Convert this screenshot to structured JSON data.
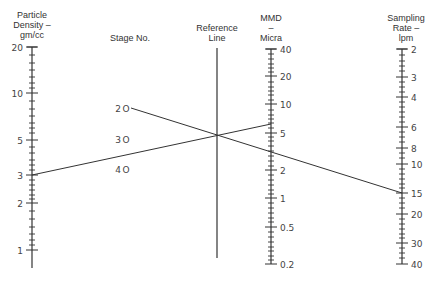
{
  "chart_data": {
    "type": "nomogram",
    "title": "",
    "axes": [
      {
        "id": "particle_density",
        "title_lines": [
          "Particle",
          "Density –",
          "gm/cc"
        ],
        "scale": "log",
        "x": 32,
        "range": [
          0.8,
          20
        ],
        "ticks": [
          {
            "value": 20,
            "label": "20",
            "y": 47
          },
          {
            "value": 10,
            "label": "10",
            "y": 93
          },
          {
            "value": 5,
            "label": "5",
            "y": 140
          },
          {
            "value": 3,
            "label": "3",
            "y": 175
          },
          {
            "value": 2,
            "label": "2",
            "y": 203
          },
          {
            "value": 1,
            "label": "1",
            "y": 250
          }
        ],
        "minor_ticks_y": [
          55,
          63,
          70,
          77,
          83,
          88,
          101,
          109,
          116,
          123,
          128,
          133,
          147,
          153,
          160,
          165,
          170,
          180,
          185,
          190,
          195,
          199,
          211,
          219,
          227,
          234,
          240,
          245
        ],
        "end_y": [
          47,
          268
        ],
        "label_side": "left"
      },
      {
        "id": "stage_no",
        "title_lines": [
          "Stage No."
        ],
        "scale": "points",
        "points": [
          {
            "value": 20,
            "label": "2O",
            "x": 131,
            "y": 108
          },
          {
            "value": 30,
            "label": "3O",
            "x": 131,
            "y": 139
          },
          {
            "value": 40,
            "label": "4O",
            "x": 131,
            "y": 169
          }
        ]
      },
      {
        "id": "reference_line",
        "title_lines": [
          "Reference",
          "Line"
        ],
        "scale": "none",
        "x": 217,
        "end_y": [
          48,
          258
        ]
      },
      {
        "id": "mmd",
        "title_lines": [
          "MMD",
          "–",
          "Micra"
        ],
        "scale": "log",
        "x": 271,
        "range": [
          0.2,
          40
        ],
        "ticks": [
          {
            "value": 40,
            "label": "40",
            "y": 49
          },
          {
            "value": 20,
            "label": "20",
            "y": 76
          },
          {
            "value": 10,
            "label": "10",
            "y": 104
          },
          {
            "value": 5,
            "label": "5",
            "y": 133
          },
          {
            "value": 2,
            "label": "2",
            "y": 170
          },
          {
            "value": 1,
            "label": "1",
            "y": 198
          },
          {
            "value": 0.5,
            "label": "0.5",
            "y": 227
          },
          {
            "value": 0.2,
            "label": "0.2",
            "y": 264
          }
        ],
        "minor_ticks_y": [
          54,
          59,
          64,
          68,
          72,
          82,
          87,
          91,
          95,
          100,
          110,
          115,
          119,
          123,
          128,
          137,
          141,
          146,
          151,
          156,
          161,
          166,
          175,
          180,
          185,
          190,
          194,
          203,
          208,
          213,
          218,
          222,
          232,
          237,
          242,
          247,
          251,
          256,
          260
        ],
        "end_y": [
          49,
          264
        ],
        "label_side": "right"
      },
      {
        "id": "sampling_rate",
        "title_lines": [
          "Sampling",
          "Rate –",
          "lpm"
        ],
        "scale": "log",
        "x": 402,
        "range": [
          2,
          40
        ],
        "ticks": [
          {
            "value": 2,
            "label": "2",
            "y": 49
          },
          {
            "value": 3,
            "label": "3",
            "y": 77
          },
          {
            "value": 4,
            "label": "4",
            "y": 97
          },
          {
            "value": 6,
            "label": "6",
            "y": 127
          },
          {
            "value": 8,
            "label": "8",
            "y": 148
          },
          {
            "value": 10,
            "label": "10",
            "y": 164
          },
          {
            "value": 15,
            "label": "15",
            "y": 193
          },
          {
            "value": 20,
            "label": "20",
            "y": 214
          },
          {
            "value": 30,
            "label": "30",
            "y": 243
          },
          {
            "value": 40,
            "label": "40",
            "y": 264
          }
        ],
        "minor_ticks_y": [
          55,
          61,
          66,
          71,
          82,
          87,
          92,
          102,
          107,
          112,
          117,
          122,
          132,
          137,
          142,
          153,
          158,
          169,
          174,
          179,
          184,
          188,
          198,
          203,
          208,
          219,
          224,
          229,
          234,
          238,
          248,
          253,
          258
        ],
        "end_y": [
          49,
          264
        ],
        "label_side": "right"
      }
    ],
    "example_lines": [
      {
        "from": {
          "axis": "particle_density",
          "value": 3,
          "x": 32,
          "y": 175
        },
        "through": {
          "axis": "reference_line",
          "x": 217,
          "y": 136
        },
        "to": {
          "axis": "mmd",
          "value": 6,
          "x": 271,
          "y": 124
        }
      },
      {
        "from": {
          "axis": "stage_no",
          "value": 20,
          "x": 131,
          "y": 108
        },
        "through": {
          "axis": "reference_line",
          "x": 217,
          "y": 136
        },
        "to": {
          "axis": "sampling_rate",
          "value": 15,
          "x": 402,
          "y": 193
        }
      }
    ],
    "grid": false,
    "legend": null
  }
}
